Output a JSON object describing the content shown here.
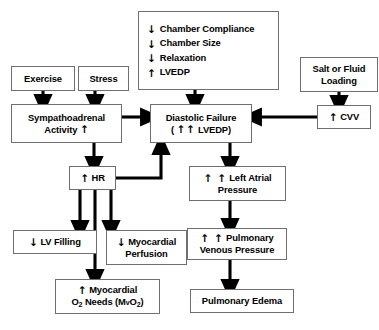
{
  "diagram": {
    "type": "flowchart",
    "colors": {
      "box_border": "#6f6f6f",
      "arrow": "#000000",
      "background": "#ffffff",
      "text": "#000000"
    },
    "glyphs": {
      "down": "↓",
      "up": "↑"
    },
    "nodes": [
      {
        "id": "exercise",
        "name": "exercise-box",
        "lines": [
          {
            "arrow": "",
            "text": "Exercise"
          }
        ]
      },
      {
        "id": "stress",
        "name": "stress-box",
        "lines": [
          {
            "arrow": "",
            "text": "Stress"
          }
        ]
      },
      {
        "id": "chamber",
        "name": "chamber-properties-box",
        "lines": [
          {
            "arrow": "↓",
            "text": "Chamber Compliance"
          },
          {
            "arrow": "↓",
            "text": "Chamber Size"
          },
          {
            "arrow": "↓",
            "text": "Relaxation"
          },
          {
            "arrow": "↑",
            "text": "LVEDP"
          }
        ]
      },
      {
        "id": "salt",
        "name": "salt-or-fluid-loading-box",
        "lines": [
          {
            "arrow": "",
            "text": "Salt or Fluid"
          },
          {
            "arrow": "",
            "text": "Loading"
          }
        ]
      },
      {
        "id": "sympatho",
        "name": "sympathoadrenal-activity-box",
        "lines": [
          {
            "arrow": "",
            "text": "Sympathoadrenal"
          },
          {
            "arrow": "",
            "text": "Activity ↑"
          }
        ]
      },
      {
        "id": "diastolic",
        "name": "diastolic-failure-box",
        "lines": [
          {
            "arrow": "",
            "text": "Diastolic Failure"
          },
          {
            "arrow": "",
            "text": "( ↑↑ LVEDP)"
          }
        ]
      },
      {
        "id": "cvv",
        "name": "cvv-box",
        "lines": [
          {
            "arrow": "↑",
            "text": "CVV"
          }
        ]
      },
      {
        "id": "hr",
        "name": "heart-rate-box",
        "lines": [
          {
            "arrow": "↑",
            "text": "HR"
          }
        ]
      },
      {
        "id": "lvfilling",
        "name": "lv-filling-box",
        "lines": [
          {
            "arrow": "↓",
            "text": "LV Filling"
          }
        ]
      },
      {
        "id": "myoperf",
        "name": "myocardial-perfusion-box",
        "lines": [
          {
            "arrow": "↓",
            "text": "Myocardial"
          },
          {
            "arrow": "",
            "text": "Perfusion"
          }
        ]
      },
      {
        "id": "o2needs",
        "name": "myocardial-o2-needs-box",
        "lines": [
          {
            "arrow": "↑",
            "text": "Myocardial"
          },
          {
            "arrow": "",
            "text": "O2 Needs (MvO2)"
          }
        ]
      },
      {
        "id": "latrial",
        "name": "left-atrial-pressure-box",
        "lines": [
          {
            "arrow": "↑ ↑",
            "text": "Left Atrial"
          },
          {
            "arrow": "",
            "text": "Pressure"
          }
        ]
      },
      {
        "id": "pvp",
        "name": "pulmonary-venous-pressure-box",
        "lines": [
          {
            "arrow": "↑ ↑",
            "text": "Pulmonary"
          },
          {
            "arrow": "",
            "text": "Venous Pressure"
          }
        ]
      },
      {
        "id": "edema",
        "name": "pulmonary-edema-box",
        "lines": [
          {
            "arrow": "",
            "text": "Pulmonary Edema"
          }
        ]
      }
    ],
    "edges": [
      {
        "from": "exercise",
        "to": "sympathoadrenal"
      },
      {
        "from": "stress",
        "to": "sympathoadrenal"
      },
      {
        "from": "chamber",
        "to": "diastolic"
      },
      {
        "from": "salt",
        "to": "cvv"
      },
      {
        "from": "cvv",
        "to": "diastolic"
      },
      {
        "from": "sympathoadrenal",
        "to": "diastolic"
      },
      {
        "from": "sympathoadrenal",
        "to": "hr"
      },
      {
        "from": "hr",
        "to": "diastolic"
      },
      {
        "from": "hr",
        "to": "lvfilling"
      },
      {
        "from": "hr",
        "to": "myoperf"
      },
      {
        "from": "hr",
        "to": "o2needs"
      },
      {
        "from": "diastolic",
        "to": "latrial"
      },
      {
        "from": "latrial",
        "to": "pvp"
      },
      {
        "from": "pvp",
        "to": "edema"
      }
    ]
  },
  "labels": {
    "exercise": "Exercise",
    "stress": "Stress",
    "chamber_compliance": "Chamber Compliance",
    "chamber_size": "Chamber Size",
    "relaxation": "Relaxation",
    "lvedp": "LVEDP",
    "salt_line1": "Salt or Fluid",
    "salt_line2": "Loading",
    "sympatho_line1": "Sympathoadrenal",
    "sympatho_line2": "Activity",
    "diastolic_line1": "Diastolic Failure",
    "diastolic_line2_open": "(",
    "diastolic_line2_text": "LVEDP)",
    "cvv": "CVV",
    "hr": "HR",
    "lv_filling": "LV Filling",
    "myoperf_line1": "Myocardial",
    "myoperf_line2": "Perfusion",
    "o2_line1": "Myocardial",
    "o2_line2_a": "O",
    "o2_line2_b": "Needs (M",
    "o2_line2_v": "v",
    "o2_line2_c": "O",
    "o2_line2_d": ")",
    "latrial_line1": "Left Atrial",
    "latrial_line2": "Pressure",
    "pvp_line1": "Pulmonary",
    "pvp_line2": "Venous Pressure",
    "edema": "Pulmonary Edema",
    "down_arrow": "↓",
    "up_arrow": "↑",
    "two": "2"
  }
}
